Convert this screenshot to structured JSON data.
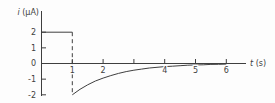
{
  "figure": {
    "background": "#fdfdfd",
    "line_color": "#3f3f3f",
    "text_color": "#3f3f3f"
  },
  "chart_data": {
    "type": "line",
    "title": "",
    "xlabel": "t (s)",
    "xlabel_var": "t",
    "xlabel_unit": " (s)",
    "ylabel": "i (μA)",
    "ylabel_var": "i",
    "ylabel_unit": " (μA)",
    "xlim": [
      0,
      6.6
    ],
    "ylim": [
      -2.1,
      3.4
    ],
    "grid": false,
    "legend": null,
    "x_ticks": [
      1,
      2,
      3,
      4,
      5,
      6
    ],
    "x_tick_labels": [
      "1",
      "2",
      "",
      "4",
      "5",
      "6"
    ],
    "y_ticks": [
      2,
      1,
      0,
      -1,
      -2
    ],
    "y_tick_labels": [
      "2",
      "1",
      "0",
      "-1",
      "-2"
    ],
    "series": [
      {
        "name": "constant-current-segment",
        "style": "solid",
        "points": [
          [
            0,
            2
          ],
          [
            1,
            2
          ]
        ]
      },
      {
        "name": "discontinuity-drop",
        "style": "dashed",
        "points": [
          [
            1,
            2
          ],
          [
            1,
            -2
          ]
        ]
      },
      {
        "name": "exponential-recovery",
        "style": "solid",
        "points": [
          [
            1,
            -2.0
          ],
          [
            1.25,
            -1.65
          ],
          [
            1.5,
            -1.36
          ],
          [
            1.75,
            -1.12
          ],
          [
            2,
            -0.93
          ],
          [
            2.25,
            -0.77
          ],
          [
            2.5,
            -0.63
          ],
          [
            2.75,
            -0.52
          ],
          [
            3,
            -0.43
          ],
          [
            3.25,
            -0.36
          ],
          [
            3.5,
            -0.29
          ],
          [
            3.75,
            -0.24
          ],
          [
            4,
            -0.2
          ],
          [
            4.25,
            -0.17
          ],
          [
            4.5,
            -0.14
          ],
          [
            4.75,
            -0.11
          ],
          [
            5,
            -0.09
          ],
          [
            5.25,
            -0.08
          ],
          [
            5.5,
            -0.06
          ],
          [
            5.75,
            -0.05
          ],
          [
            6,
            -0.04
          ]
        ]
      }
    ]
  }
}
